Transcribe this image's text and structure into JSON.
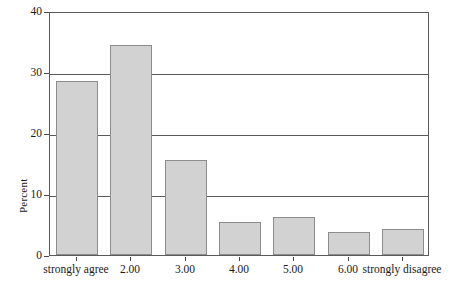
{
  "chart_data": {
    "type": "bar",
    "title": "",
    "xlabel": "",
    "ylabel": "Percent",
    "categories": [
      "strongly agree",
      "2.00",
      "3.00",
      "4.00",
      "5.00",
      "6.00",
      "strongly disagree"
    ],
    "values": [
      28.5,
      34.4,
      15.5,
      5.4,
      6.2,
      3.8,
      4.2
    ],
    "ylim": [
      0,
      40
    ],
    "yticks": [
      0,
      10,
      20,
      30,
      40
    ],
    "ytick_labels": [
      "0",
      "10",
      "20",
      "30",
      "40"
    ],
    "grid": true,
    "grid_axis": "y",
    "legend": "none",
    "bar_color": "#d2d2d2",
    "bar_edge_color": "#8c8c8c",
    "frame_color": "#5a5a5a",
    "background": "#ffffff"
  }
}
